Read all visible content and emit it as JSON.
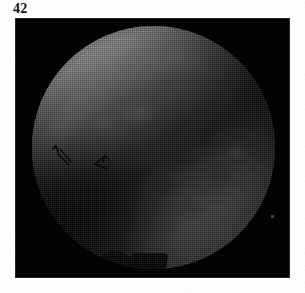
{
  "figure": {
    "number_label": "42",
    "caption": "",
    "modality": "endoscopic grayscale photograph",
    "plate": {
      "background_color": "#030303",
      "border_color": "#969696"
    },
    "field_of_view": {
      "shape": "circle",
      "description": "circular endoscopic field of view",
      "bright_region": "upper-left mucosal surface",
      "dark_region": "lower-right tissue mass in shadow",
      "divider": "diagonal shadow band running from upper-right to lower-left"
    },
    "annotations": [
      {
        "name": "arrow-1",
        "label": "",
        "points_to": "tissue boundary at left of shadow band"
      },
      {
        "name": "arrow-2",
        "label": "",
        "points_to": "tissue boundary at centre of shadow band"
      }
    ],
    "colors": {
      "paper": "#fefefe",
      "ink": "#111111",
      "plate": "#030303",
      "highlight": "#d4d4d4",
      "midtone": "#7e7e7e",
      "shadow": "#242424"
    }
  }
}
